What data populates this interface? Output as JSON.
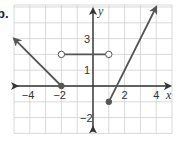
{
  "problem": {
    "label": "b."
  },
  "axes": {
    "x_label": "x",
    "y_label": "y",
    "x_ticks": [
      {
        "value": -4,
        "label": "−4"
      },
      {
        "value": -2,
        "label": "−2"
      },
      {
        "value": 2,
        "label": "2"
      },
      {
        "value": 4,
        "label": "4"
      }
    ],
    "y_ticks": [
      {
        "value": 3,
        "label": "3"
      },
      {
        "value": 1,
        "label": "1"
      },
      {
        "value": -2,
        "label": "−2"
      }
    ],
    "x_range": [
      -5,
      5
    ],
    "y_range": [
      -3,
      5
    ]
  },
  "colors": {
    "grid": "#cfcfcf",
    "axis": "#333333",
    "curve": "#555555",
    "background": "#ffffff"
  },
  "chart_data": {
    "type": "line",
    "title": "",
    "xlabel": "x",
    "ylabel": "y",
    "xlim": [
      -5,
      5
    ],
    "ylim": [
      -3,
      5
    ],
    "grid": true,
    "series": [
      {
        "name": "left ray",
        "points": [
          [
            -2,
            0
          ],
          [
            -5,
            3
          ]
        ],
        "start": "closed",
        "end": "arrow",
        "equation": "y = -x - 2, x <= -2"
      },
      {
        "name": "horizontal segment",
        "points": [
          [
            -2,
            2
          ],
          [
            1,
            2
          ]
        ],
        "start": "open",
        "end": "open",
        "equation": "y = 2, -2 < x < 1"
      },
      {
        "name": "right ray",
        "points": [
          [
            1,
            -1
          ],
          [
            4,
            5
          ]
        ],
        "start": "closed",
        "end": "arrow",
        "equation": "y = 2x - 3, x >= 1"
      }
    ]
  }
}
